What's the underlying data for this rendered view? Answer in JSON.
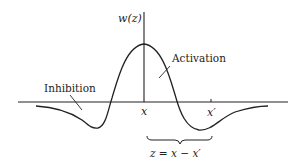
{
  "diagram": {
    "y_axis_label": "w(z)",
    "x_tick_label": "x",
    "x_prime_tick_label": "x′",
    "activation_label": "Activation",
    "inhibition_label": "Inhibition",
    "brace_label": "z = x − x′",
    "stroke_color": "#222222",
    "background_color": "#ffffff"
  }
}
